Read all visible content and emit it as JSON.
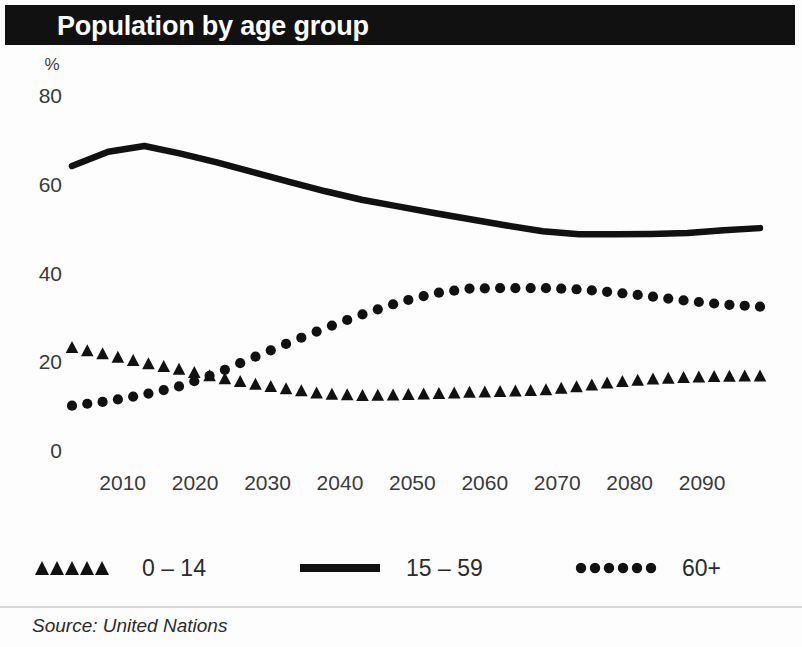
{
  "header": {
    "title": "Population by age group"
  },
  "footer": {
    "source": "Source: United Nations"
  },
  "legend": [
    {
      "label": "0 – 14",
      "marker": "triangles",
      "color": "#111111"
    },
    {
      "label": "15 – 59",
      "marker": "solid-line",
      "color": "#111111"
    },
    {
      "label": "60+",
      "marker": "dots",
      "color": "#111111"
    }
  ],
  "chart_data": {
    "type": "line",
    "title": "Population by age group",
    "xlabel": "",
    "ylabel": "%",
    "ylim": [
      0,
      80
    ],
    "yticks": [
      0,
      20,
      40,
      60,
      80
    ],
    "xlim": [
      2003,
      2098
    ],
    "xticks": [
      2010,
      2020,
      2030,
      2040,
      2050,
      2060,
      2070,
      2080,
      2090
    ],
    "grid": false,
    "legend_position": "bottom",
    "x": [
      2003,
      2008,
      2013,
      2018,
      2023,
      2028,
      2033,
      2038,
      2043,
      2048,
      2053,
      2058,
      2063,
      2068,
      2073,
      2078,
      2083,
      2088,
      2093,
      2098
    ],
    "series": [
      {
        "name": "0 – 14",
        "style": "triangles",
        "values": [
          23.0,
          21.3,
          19.5,
          18.0,
          16.3,
          14.8,
          13.6,
          12.5,
          12.2,
          12.3,
          12.6,
          12.9,
          13.1,
          13.4,
          14.2,
          15.2,
          15.9,
          16.3,
          16.5,
          16.6
        ]
      },
      {
        "name": "15 – 59",
        "style": "solid-line",
        "values": [
          64.0,
          67.2,
          68.5,
          66.8,
          64.8,
          62.6,
          60.4,
          58.3,
          56.4,
          54.9,
          53.4,
          52.0,
          50.6,
          49.3,
          48.6,
          48.6,
          48.7,
          48.9,
          49.5,
          50.0
        ]
      },
      {
        "name": "60+",
        "style": "dots",
        "values": [
          10.0,
          11.0,
          12.5,
          14.4,
          17.3,
          20.8,
          24.2,
          27.5,
          30.5,
          33.2,
          35.3,
          36.4,
          36.5,
          36.5,
          36.2,
          35.5,
          34.6,
          33.6,
          32.8,
          32.3
        ]
      }
    ]
  }
}
